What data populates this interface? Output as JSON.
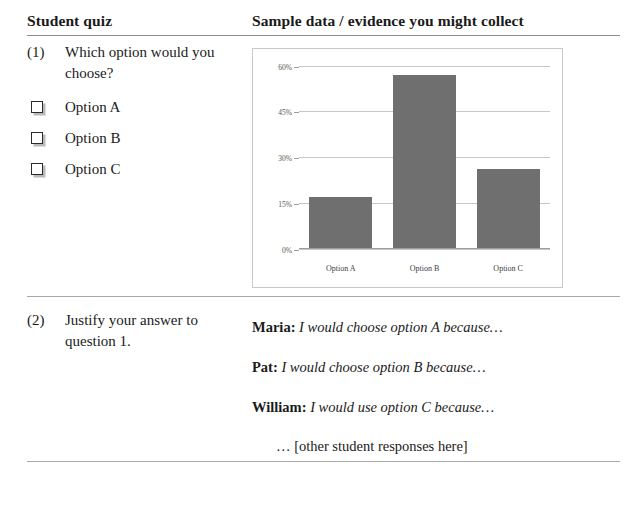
{
  "table": {
    "headers": {
      "left": "Student quiz",
      "right": "Sample data / evidence you might collect"
    },
    "rows": [
      {
        "number": "(1)",
        "question": "Which option would you choose?",
        "options": [
          {
            "checkbox": "shadowed-square-checkbox",
            "label": "Option A"
          },
          {
            "checkbox": "shadowed-square-checkbox",
            "label": "Option B"
          },
          {
            "checkbox": "shadowed-square-checkbox",
            "label": "Option C"
          }
        ]
      },
      {
        "number": "(2)",
        "question": "Justify your answer to question 1.",
        "responses": [
          {
            "name": "Maria:",
            "text": "I would choose option A because…"
          },
          {
            "name": "Pat:",
            "text": "I would choose option B because…"
          },
          {
            "name": "William:",
            "text": "I would use option C because…"
          }
        ],
        "more": "… [other student responses here]"
      }
    ]
  },
  "chart_data": {
    "type": "bar",
    "title": "",
    "xlabel": "",
    "ylabel": "",
    "categories": [
      "Option A",
      "Option B",
      "Option C"
    ],
    "values": [
      17,
      57,
      26
    ],
    "ylim": [
      0,
      60
    ],
    "yticks": [
      0,
      15,
      30,
      45,
      60
    ],
    "ytick_labels": [
      "0%",
      "15%",
      "30%",
      "45%",
      "60%"
    ],
    "grid": true,
    "legend": false,
    "bar_color": "#6f6f6f",
    "frame_color": "#c9c9c9"
  }
}
